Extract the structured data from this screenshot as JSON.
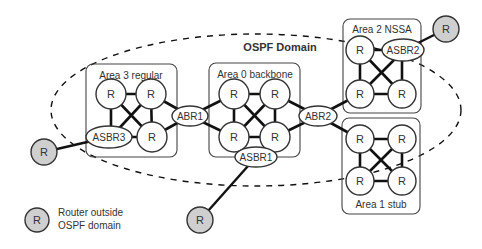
{
  "diagram": {
    "domain_title": "OSPF Domain",
    "router_label": "R",
    "areas": [
      {
        "id": "area3",
        "label": "Area 3 regular"
      },
      {
        "id": "area0",
        "label": "Area 0 backbone"
      },
      {
        "id": "area2",
        "label": "Area 2 NSSA"
      },
      {
        "id": "area1",
        "label": "Area 1 stub"
      }
    ],
    "border_routers": {
      "abr1": "ABR1",
      "abr2": "ABR2",
      "asbr1": "ASBR1",
      "asbr2": "ASBR2",
      "asbr3": "ASBR3"
    },
    "legend": {
      "symbol_label": "R",
      "line1": "Router outside",
      "line2": "OSPF domain"
    },
    "colors": {
      "external_router_fill": "#cfcfcf",
      "internal_router_fill": "#ffffff",
      "link": "#111111"
    }
  }
}
